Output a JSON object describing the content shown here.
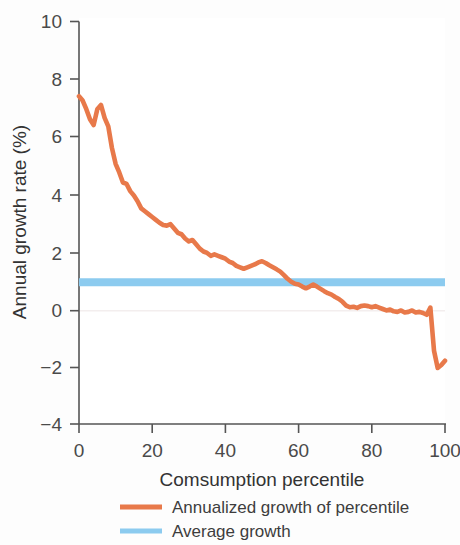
{
  "chart_data": {
    "type": "line",
    "title": "",
    "xlabel": "Comsumption percentile",
    "ylabel": "Annual growth rate (%)",
    "xlim": [
      0,
      100
    ],
    "ylim": [
      -4,
      10
    ],
    "xticks": [
      0,
      20,
      40,
      60,
      80,
      100
    ],
    "yticks": [
      -4,
      -2,
      0,
      2,
      4,
      6,
      8,
      10
    ],
    "xtick_labels": [
      "0",
      "20",
      "40",
      "60",
      "80",
      "100"
    ],
    "ytick_labels": [
      "−4",
      "−2",
      "0",
      "2",
      "4",
      "6",
      "8",
      "10"
    ],
    "grid": false,
    "legend_position": "below",
    "series": [
      {
        "name": "Annualized growth of percentile",
        "color": "#E8794A",
        "type": "line",
        "x": [
          0,
          1,
          2,
          3,
          4,
          5,
          6,
          7,
          8,
          9,
          10,
          11,
          12,
          13,
          14,
          15,
          16,
          17,
          18,
          19,
          20,
          21,
          22,
          23,
          24,
          25,
          26,
          27,
          28,
          29,
          30,
          31,
          32,
          33,
          34,
          35,
          36,
          37,
          38,
          39,
          40,
          41,
          42,
          43,
          44,
          45,
          46,
          47,
          48,
          49,
          50,
          51,
          52,
          53,
          54,
          55,
          56,
          57,
          58,
          59,
          60,
          61,
          62,
          63,
          64,
          65,
          66,
          67,
          68,
          69,
          70,
          71,
          72,
          73,
          74,
          75,
          76,
          77,
          78,
          79,
          80,
          81,
          82,
          83,
          84,
          85,
          86,
          87,
          88,
          89,
          90,
          91,
          92,
          93,
          94,
          95,
          96,
          97,
          98,
          99,
          100
        ],
        "values": [
          7.4,
          7.25,
          6.95,
          6.6,
          6.4,
          6.95,
          7.1,
          6.65,
          6.35,
          5.6,
          5.05,
          4.75,
          4.4,
          4.35,
          4.1,
          3.95,
          3.75,
          3.5,
          3.4,
          3.3,
          3.2,
          3.1,
          3.0,
          2.92,
          2.9,
          2.95,
          2.8,
          2.65,
          2.6,
          2.45,
          2.35,
          2.4,
          2.25,
          2.1,
          2.0,
          1.95,
          1.85,
          1.9,
          1.85,
          1.8,
          1.75,
          1.65,
          1.6,
          1.5,
          1.45,
          1.4,
          1.45,
          1.5,
          1.55,
          1.62,
          1.66,
          1.6,
          1.52,
          1.45,
          1.38,
          1.3,
          1.18,
          1.05,
          0.95,
          0.88,
          0.85,
          0.78,
          0.72,
          0.78,
          0.85,
          0.78,
          0.7,
          0.62,
          0.55,
          0.5,
          0.42,
          0.35,
          0.25,
          0.12,
          0.06,
          0.08,
          0.04,
          0.1,
          0.12,
          0.1,
          0.06,
          0.1,
          0.05,
          0.0,
          -0.05,
          -0.02,
          -0.08,
          -0.1,
          -0.05,
          -0.12,
          -0.1,
          -0.05,
          -0.12,
          -0.1,
          -0.14,
          -0.2,
          0.05,
          -1.45,
          -2.05,
          -1.95,
          -1.8
        ]
      },
      {
        "name": "Average growth",
        "color": "#8CCBEF",
        "type": "hline",
        "value": 0.93
      }
    ]
  },
  "legend": {
    "items": [
      {
        "label": "Annualized growth of percentile",
        "color": "#E8794A"
      },
      {
        "label": "Average growth",
        "color": "#8CCBEF"
      }
    ]
  },
  "axes": {
    "y_title": "Annual growth rate (%)",
    "x_title": "Comsumption percentile",
    "y_labels": [
      "10",
      "8",
      "6",
      "4",
      "2",
      "0",
      "−2",
      "−4"
    ],
    "x_labels": [
      "0",
      "20",
      "40",
      "60",
      "80",
      "100"
    ]
  },
  "colors": {
    "series_orange": "#E8794A",
    "series_blue": "#8CCBEF",
    "axis": "#555555",
    "text": "#3a3a3a",
    "background": "#fdfdfd"
  }
}
